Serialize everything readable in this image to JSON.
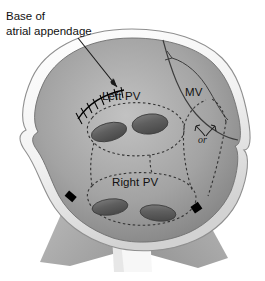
{
  "figure": {
    "type": "medical-anatomical-diagram",
    "background_color": "#ffffff"
  },
  "labels": {
    "callout_line1": "Base of",
    "callout_line2": "atrial appendage",
    "left_pv": "Left PV",
    "right_pv": "Right PV",
    "mitral_valve": "MV",
    "or_connector": "or"
  },
  "colors": {
    "tissue_light": "#d9d9d9",
    "tissue_mid": "#a8a8a8",
    "tissue_dark": "#6e6e6e",
    "rim_white": "#fdfdfd",
    "rim_edge": "#8a8a8a",
    "vein_ostium": "#5d5d5d",
    "vein_ostium_light": "#8e8e8e",
    "lesion_dash": "#3a3a3a",
    "suture": "#000000",
    "marker_black": "#000000",
    "text": "#111111"
  },
  "structures": {
    "pulmonary_vein_ostia": [
      {
        "name": "left-superior-pv-ostium",
        "cx": 109,
        "cy": 132,
        "rx": 18,
        "ry": 9,
        "rotation": -14
      },
      {
        "name": "left-inferior-pv-ostium",
        "cx": 150,
        "cy": 124,
        "rx": 18,
        "ry": 10,
        "rotation": -6
      },
      {
        "name": "right-superior-pv-ostium",
        "cx": 110,
        "cy": 207,
        "rx": 18,
        "ry": 8,
        "rotation": -7
      },
      {
        "name": "right-inferior-pv-ostium",
        "cx": 158,
        "cy": 213,
        "rx": 18,
        "ry": 8,
        "rotation": 6
      }
    ],
    "suture_line": {
      "name": "appendage-base-suture",
      "stitch_count": 9
    },
    "edge_markers": [
      {
        "name": "marker-left",
        "x": 70,
        "y": 199
      },
      {
        "name": "marker-right",
        "x": 196,
        "y": 210
      }
    ],
    "lesion_lines": [
      "left-pv-encircling-lesion",
      "right-pv-encircling-lesion",
      "connecting-lesion-to-mitral-annulus-option-a",
      "connecting-lesion-to-mitral-annulus-option-b",
      "inter-pv-connecting-lesion"
    ]
  }
}
